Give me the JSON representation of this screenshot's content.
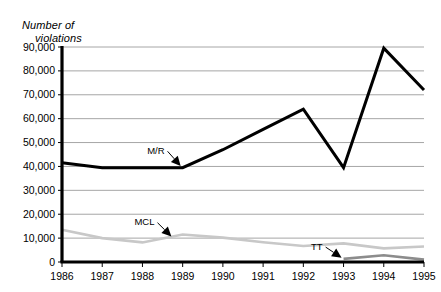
{
  "chart_data": {
    "type": "line",
    "title": "",
    "ylabel": "Number of violations",
    "ylabel_line1": "Number of",
    "ylabel_line2": "violations",
    "xlabel": "",
    "categories": [
      "1986",
      "1987",
      "1988",
      "1989",
      "1990",
      "1991",
      "1992",
      "1993",
      "1994",
      "1995"
    ],
    "x": [
      1986,
      1987,
      1988,
      1989,
      1990,
      1991,
      1992,
      1993,
      1994,
      1995
    ],
    "ylim": [
      0,
      90000
    ],
    "ytick_values": [
      0,
      10000,
      20000,
      30000,
      40000,
      50000,
      60000,
      70000,
      80000,
      90000
    ],
    "ytick_labels": [
      "0",
      "10,000",
      "20,000",
      "30,000",
      "40,000",
      "50,000",
      "60,000",
      "70,000",
      "80,000",
      "90,000"
    ],
    "grid": true,
    "grid_axis": "y",
    "legend": "inline-annotations",
    "series": [
      {
        "name": "M/R",
        "color": "#000000",
        "width": 3,
        "values": [
          41500,
          39500,
          39500,
          39500,
          47000,
          55500,
          64000,
          39500,
          89500,
          72000
        ]
      },
      {
        "name": "MCL",
        "color": "#c8c8c8",
        "width": 2.6,
        "values": [
          13500,
          10000,
          8200,
          11500,
          10200,
          8300,
          6700,
          7800,
          5700,
          6500
        ]
      },
      {
        "name": "TT",
        "color": "#8c8c8c",
        "width": 2.6,
        "start_index": 7,
        "values": [
          null,
          null,
          null,
          null,
          null,
          null,
          null,
          1300,
          2800,
          1000
        ]
      }
    ],
    "annotations": [
      {
        "label": "M/R",
        "label_x": 1988.55,
        "label_y": 45300,
        "arrow_to_x": 1988.95,
        "arrow_to_y": 40200
      },
      {
        "label": "MCL",
        "label_x": 1988.3,
        "label_y": 15400,
        "arrow_to_x": 1988.72,
        "arrow_to_y": 10700
      },
      {
        "label": "TT",
        "label_x": 1992.48,
        "label_y": 5200,
        "arrow_to_x": 1992.95,
        "arrow_to_y": 1800
      }
    ]
  },
  "colors": {
    "background": "#ffffff",
    "axis": "#000000",
    "gridline": "#a6a6a6",
    "mr": "#000000",
    "mcl": "#c8c8c8",
    "tt": "#8c8c8c"
  }
}
